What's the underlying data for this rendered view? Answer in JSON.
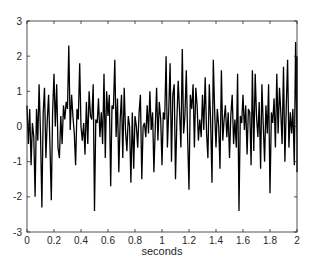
{
  "chart_data": {
    "type": "line",
    "title": "",
    "xlabel": "seconds",
    "ylabel": "",
    "xlim": [
      0,
      2
    ],
    "ylim": [
      -3,
      3
    ],
    "xticks": [
      0,
      0.2,
      0.4,
      0.6,
      0.8,
      1,
      1.2,
      1.4,
      1.6,
      1.8,
      2
    ],
    "xtick_labels": [
      "0",
      "0.2",
      "0.4",
      "0.6",
      "0.8",
      "1",
      "1.2",
      "1.4",
      "1.6",
      "1.8",
      "2"
    ],
    "yticks": [
      -3,
      -2,
      -1,
      0,
      1,
      2,
      3
    ],
    "ytick_labels": [
      "-3",
      "-2",
      "-1",
      "0",
      "1",
      "2",
      "3"
    ],
    "grid": false,
    "legend": null,
    "line_color": "#000000",
    "series": [
      {
        "name": "signal",
        "x_start": 0,
        "x_step": 0.01,
        "values": [
          0.6,
          -0.5,
          0.5,
          -1.1,
          0.1,
          -0.3,
          -2.0,
          0.5,
          -0.4,
          1.2,
          -0.2,
          -2.3,
          0.4,
          1.1,
          -0.9,
          0.2,
          0.9,
          -0.6,
          -2.1,
          0.4,
          1.5,
          0.0,
          1.2,
          -0.6,
          -0.9,
          0.3,
          -0.5,
          0.6,
          0.2,
          0.7,
          0.5,
          2.3,
          -0.1,
          0.9,
          0.3,
          -0.2,
          -1.1,
          0.5,
          0.2,
          1.8,
          0.0,
          -0.4,
          0.1,
          -0.8,
          0.7,
          -0.5,
          1.0,
          0.3,
          0.2,
          1.2,
          -2.4,
          0.2,
          0.1,
          0.8,
          -0.3,
          0.4,
          -0.5,
          1.5,
          -0.9,
          1.0,
          0.3,
          0.9,
          -1.7,
          0.6,
          0.5,
          1.9,
          -0.3,
          0.8,
          -1.3,
          0.2,
          0.9,
          -0.9,
          1.1,
          -0.1,
          -0.7,
          0.3,
          0.0,
          -1.6,
          0.4,
          -1.2,
          0.3,
          0.0,
          -0.6,
          0.4,
          0.9,
          -1.5,
          0.0,
          0.1,
          -0.3,
          0.6,
          -0.2,
          1.0,
          -0.1,
          0.4,
          -1.3,
          0.0,
          1.1,
          -0.4,
          0.7,
          0.2,
          -1.1,
          0.4,
          0.2,
          2.0,
          -0.6,
          0.5,
          1.8,
          -1.0,
          0.9,
          1.2,
          -1.5,
          0.2,
          1.3,
          0.4,
          -0.6,
          2.2,
          -0.2,
          0.3,
          1.6,
          -0.4,
          -1.8,
          0.9,
          0.5,
          1.2,
          -0.6,
          1.1,
          0.6,
          -0.4,
          0.2,
          -0.3,
          0.9,
          -0.1,
          1.4,
          -0.2,
          -0.9,
          1.2,
          0.2,
          -1.6,
          1.9,
          0.4,
          -0.6,
          0.5,
          0.0,
          -1.2,
          1.6,
          -0.4,
          0.2,
          0.6,
          -0.3,
          0.4,
          -0.9,
          0.3,
          0.9,
          -0.5,
          0.2,
          -0.6,
          1.5,
          -2.4,
          0.3,
          0.1,
          0.9,
          -0.1,
          0.6,
          -0.8,
          0.5,
          0.4,
          -1.1,
          1.6,
          -0.7,
          1.5,
          0.3,
          -0.3,
          0.7,
          -1.2,
          1.2,
          0.0,
          -1.0,
          0.6,
          -0.2,
          1.2,
          -1.9,
          0.4,
          0.1,
          0.8,
          -0.6,
          1.5,
          -0.2,
          1.1,
          0.4,
          -0.5,
          1.7,
          -1.0,
          0.5,
          1.9,
          -0.6,
          0.4,
          -0.2,
          0.5,
          -1.1,
          2.4,
          -0.4,
          0.2,
          1.3,
          -0.9,
          0.4,
          2.0,
          -0.5,
          0.3,
          1.2,
          -1.3,
          0.5,
          -0.3,
          0.9,
          -0.8,
          0.4,
          -0.6,
          0.7,
          -0.9
        ]
      }
    ]
  }
}
